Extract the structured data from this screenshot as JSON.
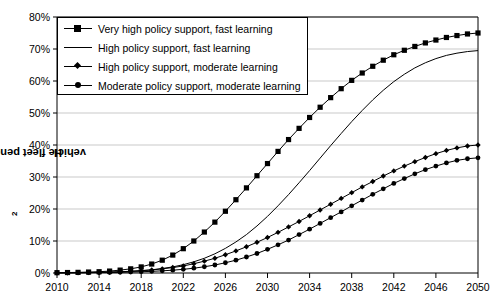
{
  "chart_data": {
    "type": "line",
    "title": "",
    "xlabel": "",
    "ylabel": "H2 vehicle fleet penetration",
    "ylabel_main": "H",
    "ylabel_sub": "2",
    "ylabel_rest": " vehicle fleet penetration",
    "xlim": [
      2010,
      2050
    ],
    "ylim": [
      0,
      80
    ],
    "grid": true,
    "legend_position": "top-left",
    "x_tick_labels": [
      "2010",
      "2014",
      "2018",
      "2022",
      "2026",
      "2030",
      "2034",
      "2038",
      "2042",
      "2046",
      "2050"
    ],
    "x_tick_values": [
      2010,
      2014,
      2018,
      2022,
      2026,
      2030,
      2034,
      2038,
      2042,
      2046,
      2050
    ],
    "y_tick_labels": [
      "0%",
      "10%",
      "20%",
      "30%",
      "40%",
      "50%",
      "60%",
      "70%",
      "80%"
    ],
    "y_tick_values": [
      0,
      10,
      20,
      30,
      40,
      50,
      60,
      70,
      80
    ],
    "x": [
      2010,
      2011,
      2012,
      2013,
      2014,
      2015,
      2016,
      2017,
      2018,
      2019,
      2020,
      2021,
      2022,
      2023,
      2024,
      2025,
      2026,
      2027,
      2028,
      2029,
      2030,
      2031,
      2032,
      2033,
      2034,
      2035,
      2036,
      2037,
      2038,
      2039,
      2040,
      2041,
      2042,
      2043,
      2044,
      2045,
      2046,
      2047,
      2048,
      2049,
      2050
    ],
    "series": [
      {
        "name": "Very high policy support, fast learning",
        "marker": "square",
        "color": "#000000",
        "values": [
          0.1,
          0.15,
          0.2,
          0.3,
          0.4,
          0.6,
          0.9,
          1.3,
          1.9,
          2.8,
          4.0,
          5.6,
          7.6,
          10.0,
          12.8,
          15.9,
          19.3,
          22.9,
          26.6,
          30.4,
          34.2,
          38.0,
          41.7,
          45.2,
          48.6,
          51.8,
          54.8,
          57.6,
          60.2,
          62.5,
          64.6,
          66.5,
          68.2,
          69.6,
          70.8,
          71.9,
          72.8,
          73.6,
          74.2,
          74.7,
          75.0
        ]
      },
      {
        "name": "High policy support, fast learning",
        "marker": "none",
        "color": "#000000",
        "values": [
          0.05,
          0.07,
          0.1,
          0.14,
          0.2,
          0.3,
          0.4,
          0.55,
          0.75,
          1.0,
          1.4,
          1.9,
          2.6,
          3.5,
          4.6,
          6.0,
          7.7,
          9.7,
          12.0,
          14.7,
          17.7,
          21.0,
          24.5,
          28.2,
          32.0,
          35.9,
          39.8,
          43.6,
          47.3,
          50.8,
          54.1,
          57.1,
          59.8,
          62.1,
          64.1,
          65.7,
          67.0,
          68.0,
          68.7,
          69.2,
          69.5
        ]
      },
      {
        "name": "High policy support, moderate learning",
        "marker": "diamond",
        "color": "#000000",
        "values": [
          0.05,
          0.07,
          0.1,
          0.13,
          0.18,
          0.25,
          0.35,
          0.5,
          0.7,
          0.95,
          1.3,
          1.7,
          2.2,
          2.9,
          3.7,
          4.6,
          5.7,
          6.9,
          8.2,
          9.6,
          11.1,
          12.7,
          14.4,
          16.1,
          17.9,
          19.7,
          21.5,
          23.3,
          25.1,
          26.9,
          28.6,
          30.3,
          31.9,
          33.4,
          34.8,
          36.1,
          37.3,
          38.3,
          39.1,
          39.7,
          40.0
        ]
      },
      {
        "name": "Moderate policy support, moderate learning",
        "marker": "circle",
        "color": "#000000",
        "values": [
          0.05,
          0.06,
          0.08,
          0.1,
          0.13,
          0.17,
          0.22,
          0.3,
          0.4,
          0.52,
          0.68,
          0.88,
          1.15,
          1.5,
          1.95,
          2.5,
          3.2,
          4.0,
          5.0,
          6.1,
          7.4,
          8.8,
          10.3,
          12.0,
          13.7,
          15.5,
          17.3,
          19.1,
          21.0,
          22.8,
          24.6,
          26.3,
          28.0,
          29.5,
          31.0,
          32.3,
          33.4,
          34.4,
          35.2,
          35.7,
          36.0
        ]
      }
    ]
  },
  "legend": {
    "items": [
      {
        "label": "Very high policy support, fast learning",
        "marker": "square"
      },
      {
        "label": "High policy support, fast learning",
        "marker": "line"
      },
      {
        "label": "High policy support, moderate learning",
        "marker": "diamond"
      },
      {
        "label": "Moderate policy support, moderate learning",
        "marker": "circle"
      }
    ]
  },
  "colors": {
    "axis": "#000000",
    "grid": "#c9c9c9",
    "series": "#000000",
    "background": "#ffffff"
  }
}
